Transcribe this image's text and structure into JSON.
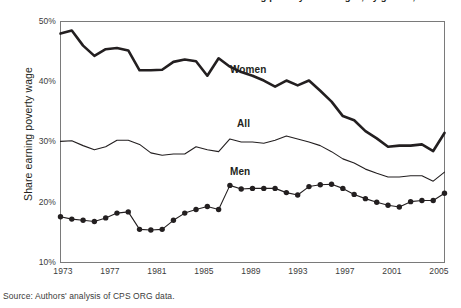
{
  "figure": {
    "title": "Share of workers earning poverty-level wages, by gender, 1973-2007",
    "source_note": "Source: Authors' analysis of CPS ORG data.",
    "ylabel": "Share earning poverty wage",
    "series_labels": {
      "women": "Women",
      "all": "All",
      "men": "Men"
    },
    "colors": {
      "line": "#231f20",
      "axis": "#7a7a7a",
      "text": "#231f20",
      "tick_text": "#3b3b3b",
      "background": "#ffffff"
    }
  },
  "chart_data": {
    "type": "line",
    "title": "Share of workers earning poverty-level wages, by gender, 1973-2007",
    "xlabel": "",
    "ylabel": "Share earning poverty wage",
    "xlim": [
      1973,
      2007
    ],
    "ylim": [
      10,
      50
    ],
    "ytick_labels": [
      "10%",
      "20%",
      "30%",
      "40%",
      "50%"
    ],
    "ytick_values": [
      10,
      20,
      30,
      40,
      50
    ],
    "xtick_labels": [
      "1973",
      "1977",
      "1981",
      "1985",
      "1989",
      "1993",
      "1997",
      "2001",
      "2005"
    ],
    "xtick_values": [
      1973,
      1977,
      1981,
      1985,
      1989,
      1993,
      1997,
      2001,
      2005
    ],
    "grid": false,
    "legend": "inline-annotations",
    "x": [
      1973,
      1974,
      1975,
      1976,
      1977,
      1978,
      1979,
      1980,
      1981,
      1982,
      1983,
      1984,
      1985,
      1986,
      1987,
      1988,
      1989,
      1990,
      1991,
      1992,
      1993,
      1994,
      1995,
      1996,
      1997,
      1998,
      1999,
      2000,
      2001,
      2002,
      2003,
      2004,
      2005,
      2006,
      2007
    ],
    "series": [
      {
        "name": "Women",
        "style": "thick-line",
        "markers": false,
        "values": [
          48.0,
          48.5,
          46.0,
          44.3,
          45.4,
          45.6,
          45.2,
          41.9,
          41.9,
          42.0,
          43.3,
          43.7,
          43.4,
          41.0,
          43.9,
          42.5,
          41.6,
          41.0,
          40.2,
          39.2,
          40.2,
          39.4,
          40.2,
          38.5,
          36.7,
          34.3,
          33.6,
          31.8,
          30.6,
          29.2,
          29.4,
          29.4,
          29.6,
          28.5,
          31.5
        ]
      },
      {
        "name": "All",
        "style": "thin-line",
        "markers": false,
        "values": [
          30.1,
          30.2,
          29.4,
          28.7,
          29.2,
          30.3,
          30.3,
          29.6,
          28.2,
          27.8,
          28.0,
          28.0,
          29.2,
          28.7,
          28.4,
          30.5,
          30.0,
          30.0,
          29.8,
          30.3,
          31.0,
          30.5,
          30.0,
          29.4,
          28.4,
          27.2,
          26.5,
          25.5,
          24.8,
          24.2,
          24.2,
          24.4,
          24.4,
          23.5,
          25.0
        ]
      },
      {
        "name": "Men",
        "style": "thin-line",
        "markers": true,
        "values": [
          17.6,
          17.2,
          17.0,
          16.8,
          17.4,
          18.2,
          18.4,
          15.5,
          15.4,
          15.5,
          17.0,
          18.2,
          18.8,
          19.3,
          18.8,
          22.8,
          22.2,
          22.3,
          22.3,
          22.3,
          21.6,
          21.2,
          22.6,
          22.9,
          23.0,
          22.3,
          21.3,
          20.6,
          20.0,
          19.5,
          19.2,
          20.1,
          20.3,
          20.3,
          21.5
        ]
      }
    ]
  }
}
